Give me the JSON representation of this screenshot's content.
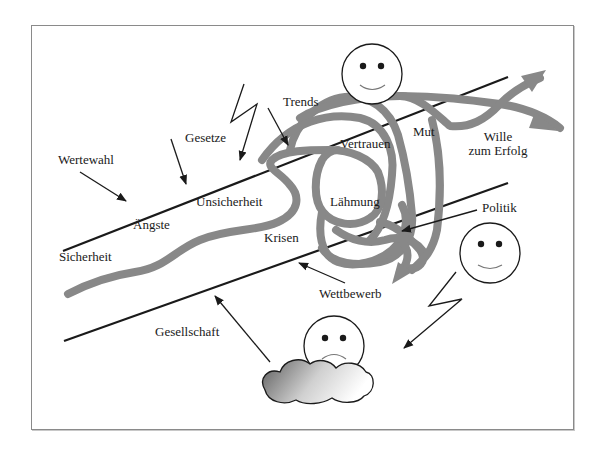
{
  "diagram": {
    "colors": {
      "frame": "#8a8a8a",
      "road_lines": "#1a1a1a",
      "path_stroke": "#888888",
      "text": "#1a1a1a",
      "cloud_dark": "#6e6e6e",
      "cloud_light": "#ffffff"
    },
    "labels": {
      "wertewahl": "Wertewahl",
      "gesetze": "Gesetze",
      "trends": "Trends",
      "unsicherheit": "Unsicherheit",
      "aengste": "Ängste",
      "sicherheit": "Sicherheit",
      "krisen": "Krisen",
      "vertrauen": "Vertrauen",
      "mut": "Mut",
      "laehmung": "Lähmung",
      "wille_line1": "Wille",
      "wille_line2": "zum Erfolg",
      "politik": "Politik",
      "wettbewerb": "Wettbewerb",
      "gesellschaft": "Gesellschaft"
    },
    "icons": {
      "happy_face_top": "smiley-happy",
      "happy_face_right": "smiley-happy",
      "sad_face": "smiley-sad",
      "cloud": "cloud",
      "lightning_top": "lightning-bolt",
      "lightning_right": "lightning-bolt"
    }
  }
}
